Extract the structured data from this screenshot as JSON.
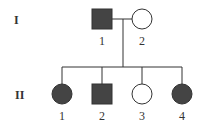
{
  "diagram": {
    "type": "pedigree",
    "generations": [
      {
        "label": "I",
        "individuals": [
          {
            "id": "1",
            "sex": "male",
            "affected": true
          },
          {
            "id": "2",
            "sex": "female",
            "affected": false
          }
        ]
      },
      {
        "label": "II",
        "individuals": [
          {
            "id": "1",
            "sex": "female",
            "affected": true
          },
          {
            "id": "2",
            "sex": "male",
            "affected": true
          },
          {
            "id": "3",
            "sex": "female",
            "affected": false
          },
          {
            "id": "4",
            "sex": "female",
            "affected": true
          }
        ]
      }
    ],
    "colors": {
      "affected": "#444444",
      "stroke": "#333333",
      "unaffected": "#ffffff"
    }
  }
}
